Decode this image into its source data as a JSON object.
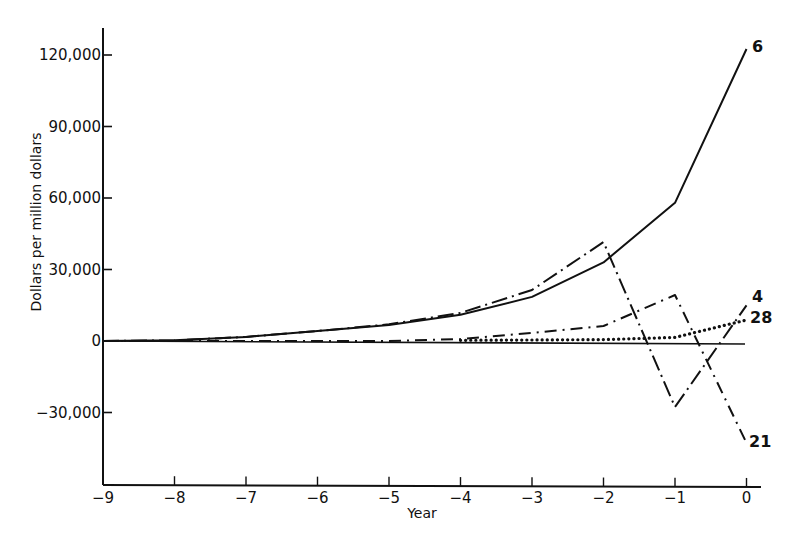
{
  "chart_data": {
    "type": "line",
    "title": "",
    "xlabel": "Year",
    "ylabel": "Dollars per million dollars",
    "xlim": [
      -9,
      0
    ],
    "ylim": [
      -50000,
      130000
    ],
    "grid": false,
    "legend_position": "inline labels at right end of each line",
    "x": [
      -9,
      -8,
      -7,
      -6,
      -5,
      -4,
      -3,
      -2,
      -1,
      0
    ],
    "x_tick_labels": [
      "-9",
      "-8",
      "-7",
      "-6",
      "-5",
      "-4",
      "-3",
      "-2",
      "-1",
      "0"
    ],
    "y_ticks": [
      120000,
      90000,
      60000,
      30000,
      0,
      -30000
    ],
    "y_tick_labels": [
      "120,000",
      "90,000",
      "60,000",
      "30,000",
      "0",
      "-30,000"
    ],
    "series": [
      {
        "name": "6",
        "style": "solid",
        "x": [
          -9,
          -8,
          -7,
          -6,
          -5,
          -4,
          -3,
          -2,
          -1,
          0
        ],
        "values": [
          0,
          300,
          1700,
          4200,
          6700,
          11000,
          18500,
          33000,
          58000,
          122500
        ]
      },
      {
        "name": "4",
        "style": "long-dash-dot",
        "x": [
          -9,
          -8,
          -7,
          -6,
          -5,
          -4,
          -3,
          -2,
          -1,
          0
        ],
        "values": [
          0,
          300,
          1700,
          4200,
          7000,
          11800,
          21400,
          41500,
          -27700,
          15000
        ]
      },
      {
        "name": "21",
        "style": "dash-dot",
        "x": [
          -9,
          -8,
          -7,
          -6,
          -5,
          -4,
          -3,
          -2,
          -1,
          0
        ],
        "values": [
          0,
          0,
          0,
          0,
          0,
          800,
          3400,
          6300,
          19300,
          -42800
        ]
      },
      {
        "name": "28",
        "style": "dotted",
        "x": [
          -4,
          -3,
          -2,
          -1,
          0
        ],
        "values": [
          300,
          400,
          600,
          1500,
          8800
        ]
      }
    ],
    "annotations": [
      {
        "text": "6",
        "near": "series 6 end"
      },
      {
        "text": "4",
        "near": "series 4 end"
      },
      {
        "text": "28",
        "near": "series 28 end"
      },
      {
        "text": "21",
        "near": "series 21 end"
      }
    ]
  },
  "labels": {
    "xlabel": "Year",
    "ylabel": "Dollars per million dollars"
  }
}
